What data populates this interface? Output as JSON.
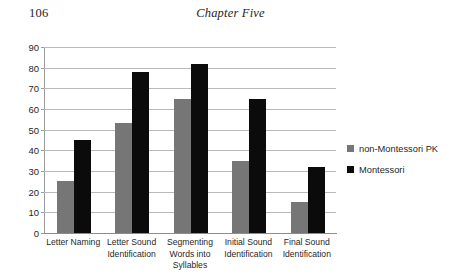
{
  "page": {
    "number": "106",
    "running_head": "Chapter Five"
  },
  "chart_data": {
    "type": "bar",
    "title": "",
    "xlabel": "",
    "ylabel": "",
    "ylim": [
      0,
      90
    ],
    "ytick_step": 10,
    "yticks": [
      "90",
      "80",
      "70",
      "60",
      "50",
      "40",
      "30",
      "20",
      "10",
      "0"
    ],
    "grid": true,
    "legend_position": "right",
    "categories": [
      "Letter Naming",
      "Letter Sound Identification",
      "Segmenting Words into Syllables",
      "Initial Sound Identification",
      "Final Sound Identification"
    ],
    "series": [
      {
        "name": "non-Montessori PK",
        "color": "#767676",
        "values": [
          25,
          53,
          65,
          35,
          15
        ]
      },
      {
        "name": "Montessori",
        "color": "#0b0b0b",
        "values": [
          45,
          78,
          82,
          65,
          32
        ]
      }
    ]
  }
}
